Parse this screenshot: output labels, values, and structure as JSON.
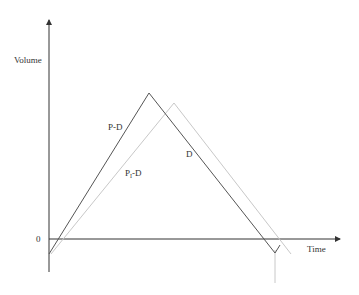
{
  "diagram": {
    "type": "line",
    "axes": {
      "y_label": "Volume",
      "x_label": "Time",
      "origin_label": "0"
    },
    "curves": [
      {
        "name": "P-D",
        "label": "P-D",
        "color": "#555555",
        "points": [
          [
            49,
            254
          ],
          [
            149,
            93
          ],
          [
            275,
            253
          ],
          [
            280,
            245
          ]
        ]
      },
      {
        "name": "PI-D",
        "label_main": "P",
        "label_sub": "I",
        "label_tail": "-D",
        "color": "#c8c8c8",
        "points": [
          [
            51,
            254
          ],
          [
            174,
            103
          ],
          [
            291,
            254
          ]
        ]
      },
      {
        "name": "D",
        "label": "D"
      }
    ],
    "colors": {
      "axis": "#333333",
      "dark_line": "#555555",
      "light_line": "#c8c8c8"
    }
  }
}
